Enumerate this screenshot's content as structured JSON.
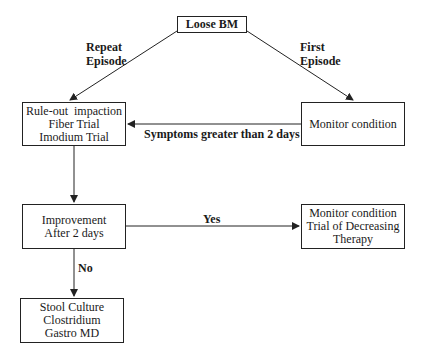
{
  "diagram": {
    "nodes": {
      "loose_bm": {
        "lines": [
          "Loose BM"
        ]
      },
      "rule_out": {
        "lines": [
          "Rule-out  impaction",
          "Fiber Trial",
          "Imodium Trial"
        ]
      },
      "monitor": {
        "lines": [
          "Monitor condition"
        ]
      },
      "improvement": {
        "lines": [
          "Improvement",
          "After 2 days"
        ]
      },
      "monitor_trial": {
        "lines": [
          "Monitor condition",
          "Trial of Decreasing",
          "Therapy"
        ]
      },
      "stool": {
        "lines": [
          "Stool Culture",
          "Clostridium",
          "Gastro MD"
        ]
      }
    },
    "edges": {
      "repeat": {
        "from": "loose_bm",
        "to": "rule_out",
        "lines": [
          "Repeat",
          "Episode"
        ]
      },
      "first": {
        "from": "loose_bm",
        "to": "monitor",
        "lines": [
          "First",
          "Episode"
        ]
      },
      "symptoms": {
        "from": "monitor",
        "to": "rule_out",
        "label": "Symptoms greater than 2 days"
      },
      "rule_to_improve": {
        "from": "rule_out",
        "to": "improvement",
        "label": ""
      },
      "yes": {
        "from": "improvement",
        "to": "monitor_trial",
        "label": "Yes"
      },
      "no": {
        "from": "improvement",
        "to": "stool",
        "label": "No"
      }
    }
  }
}
